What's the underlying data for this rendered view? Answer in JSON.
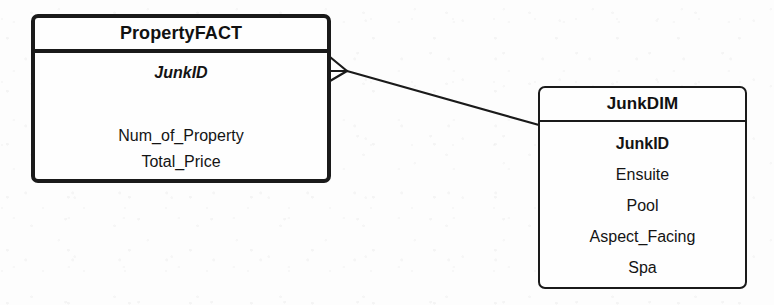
{
  "diagram": {
    "type": "entity-relationship-diagram",
    "notation": "crow-foot",
    "background_color": "#fdfdfd",
    "line_color": "#1a1a1a",
    "entities": [
      {
        "id": "property-fact",
        "name": "PropertyFACT",
        "role": "fact-table",
        "attributes": [
          {
            "label": "JunkID",
            "style": "bold-italic",
            "key": "foreign-key"
          },
          {
            "label": "Num_of_Property",
            "style": "normal",
            "key": "measure"
          },
          {
            "label": "Total_Price",
            "style": "normal",
            "key": "measure"
          }
        ]
      },
      {
        "id": "junk-dim",
        "name": "JunkDIM",
        "role": "dimension-table",
        "attributes": [
          {
            "label": "JunkID",
            "style": "bold",
            "key": "primary-key"
          },
          {
            "label": "Ensuite",
            "style": "normal",
            "key": "attribute"
          },
          {
            "label": "Pool",
            "style": "normal",
            "key": "attribute"
          },
          {
            "label": "Aspect_Facing",
            "style": "normal",
            "key": "attribute"
          },
          {
            "label": "Spa",
            "style": "normal",
            "key": "attribute"
          }
        ]
      }
    ],
    "relationships": [
      {
        "id": "fact-to-dim",
        "from": "property-fact",
        "to": "junk-dim",
        "from_cardinality": "many",
        "to_cardinality": "one",
        "from_marker": "crow-foot",
        "to_marker": "plain"
      }
    ]
  }
}
